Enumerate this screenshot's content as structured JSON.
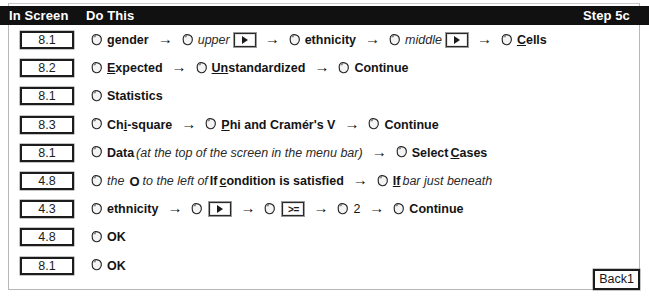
{
  "header": {
    "col_screen": "In Screen",
    "col_action": "Do This",
    "step_label": "Step 5c"
  },
  "footer": {
    "back_label": "Back1"
  },
  "icons": {
    "mouse": "mouse-click-icon",
    "arrow": "right-arrow-icon",
    "move_button": "move-right-button-icon",
    "ge_button": "greater-equal-button-icon"
  },
  "rows": [
    {
      "screen": "8.1",
      "parts": [
        {
          "type": "mouse"
        },
        {
          "type": "text",
          "style": "bold",
          "value": "gender"
        },
        {
          "type": "arrow"
        },
        {
          "type": "mouse"
        },
        {
          "type": "text",
          "style": "ital",
          "value": "upper"
        },
        {
          "type": "btn-arrow"
        },
        {
          "type": "arrow"
        },
        {
          "type": "mouse"
        },
        {
          "type": "text",
          "style": "bold",
          "value": "ethnicity"
        },
        {
          "type": "arrow"
        },
        {
          "type": "mouse"
        },
        {
          "type": "text",
          "style": "ital",
          "value": "middle"
        },
        {
          "type": "btn-arrow"
        },
        {
          "type": "arrow"
        },
        {
          "type": "mouse"
        },
        {
          "type": "text",
          "style": "bold",
          "underline_first": 1,
          "value": "Cells"
        }
      ]
    },
    {
      "screen": "8.2",
      "parts": [
        {
          "type": "mouse"
        },
        {
          "type": "text",
          "style": "bold",
          "underline_first": 1,
          "value": "Expected"
        },
        {
          "type": "arrow"
        },
        {
          "type": "mouse"
        },
        {
          "type": "text",
          "style": "bold",
          "underline_first": 2,
          "value": "Unstandardized"
        },
        {
          "type": "arrow"
        },
        {
          "type": "mouse"
        },
        {
          "type": "text",
          "style": "bold",
          "value": "Continue"
        }
      ]
    },
    {
      "screen": "8.1",
      "parts": [
        {
          "type": "mouse"
        },
        {
          "type": "text",
          "style": "bold",
          "value": "Statistics"
        }
      ]
    },
    {
      "screen": "8.3",
      "parts": [
        {
          "type": "mouse"
        },
        {
          "type": "text",
          "style": "bold",
          "underline_range": [
            2,
            3
          ],
          "value": "Chi-square"
        },
        {
          "type": "arrow"
        },
        {
          "type": "mouse"
        },
        {
          "type": "text",
          "style": "bold",
          "underline_first": 1,
          "value": "Phi and Cramér's V"
        },
        {
          "type": "arrow"
        },
        {
          "type": "mouse"
        },
        {
          "type": "text",
          "style": "bold",
          "value": "Continue"
        }
      ]
    },
    {
      "screen": "8.1",
      "parts": [
        {
          "type": "mouse"
        },
        {
          "type": "text",
          "style": "bold",
          "value": "Data"
        },
        {
          "type": "text",
          "style": "ital",
          "value": "(at the top of the screen in the menu bar)"
        },
        {
          "type": "arrow"
        },
        {
          "type": "mouse"
        },
        {
          "type": "text",
          "style": "bold",
          "value": "Select "
        },
        {
          "type": "text",
          "style": "bold",
          "underline_first": 1,
          "value": "Cases"
        }
      ]
    },
    {
      "screen": "4.8",
      "parts": [
        {
          "type": "mouse"
        },
        {
          "type": "text",
          "style": "ital",
          "value": "the"
        },
        {
          "type": "text",
          "style": "oglyph",
          "value": "O"
        },
        {
          "type": "text",
          "style": "ital",
          "value": "to the left of"
        },
        {
          "type": "text",
          "style": "bold",
          "value": "If "
        },
        {
          "type": "text",
          "style": "bold",
          "underline_first": 1,
          "value": "condition is satisfied"
        },
        {
          "type": "arrow"
        },
        {
          "type": "mouse"
        },
        {
          "type": "text",
          "style": "bold",
          "underline_first": 2,
          "value": "If"
        },
        {
          "type": "text",
          "style": "ital",
          "value": "bar just beneath"
        }
      ]
    },
    {
      "screen": "4.3",
      "parts": [
        {
          "type": "mouse"
        },
        {
          "type": "text",
          "style": "bold",
          "value": "ethnicity"
        },
        {
          "type": "arrow"
        },
        {
          "type": "mouse"
        },
        {
          "type": "btn-arrow"
        },
        {
          "type": "arrow"
        },
        {
          "type": "mouse"
        },
        {
          "type": "btn-ge"
        },
        {
          "type": "arrow"
        },
        {
          "type": "mouse"
        },
        {
          "type": "text",
          "style": "plain",
          "value": "2"
        },
        {
          "type": "arrow"
        },
        {
          "type": "mouse"
        },
        {
          "type": "text",
          "style": "bold",
          "value": "Continue"
        }
      ]
    },
    {
      "screen": "4.8",
      "parts": [
        {
          "type": "mouse"
        },
        {
          "type": "text",
          "style": "bold",
          "value": "OK"
        }
      ]
    },
    {
      "screen": "8.1",
      "parts": [
        {
          "type": "mouse"
        },
        {
          "type": "text",
          "style": "bold",
          "value": "OK"
        }
      ]
    }
  ],
  "arrow_glyph": "→",
  "ge_glyph": ">="
}
